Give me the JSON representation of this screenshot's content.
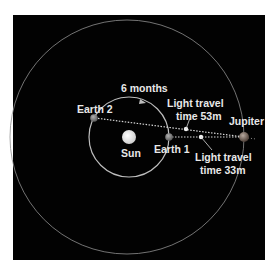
{
  "diagram": {
    "background_color": "#020202",
    "labels": {
      "sun": "Sun",
      "earth1": "Earth 1",
      "earth2": "Earth 2",
      "jupiter": "Jupiter",
      "six_months": "6 months",
      "light_53_line1": "Light travel",
      "light_53_line2": "time 53m",
      "light_33_line1": "Light travel",
      "light_33_line2": "time 33m"
    },
    "bodies": [
      {
        "name": "Sun",
        "color": "#e6e6e6"
      },
      {
        "name": "Earth 1",
        "color": "#8a8a8a"
      },
      {
        "name": "Earth 2",
        "color": "#8a8a8a"
      },
      {
        "name": "Jupiter",
        "color": "#7a6a62"
      }
    ],
    "orbits": [
      {
        "name": "earth-orbit",
        "color": "#bdbdbd"
      },
      {
        "name": "jupiter-orbit",
        "color": "#8f8f8f"
      }
    ],
    "paths": [
      {
        "from": "Earth 2",
        "to": "Jupiter",
        "label": "Light travel time 53m"
      },
      {
        "from": "Earth 1",
        "to": "Jupiter",
        "label": "Light travel time 33m"
      }
    ]
  }
}
